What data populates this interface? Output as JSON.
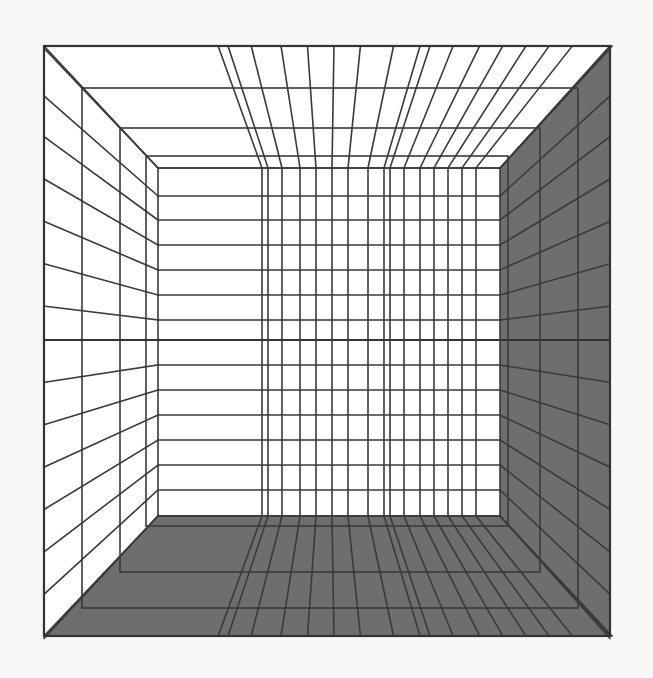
{
  "figure": {
    "title": "One-point perspective grid room",
    "colors": {
      "paper": "#f7f7f5",
      "line": "#3a3a3a",
      "shade": "#6e6e6e",
      "wall_light": "#ffffff"
    },
    "geometry": {
      "outer_frame": [
        44,
        46,
        610,
        636
      ],
      "back_wall": [
        158,
        168,
        500,
        516
      ],
      "frames": [
        [
          82,
          88,
          578,
          608
        ],
        [
          120,
          128,
          540,
          572
        ],
        [
          146,
          156,
          508,
          526
        ]
      ],
      "horizon_y": 340,
      "back_wall_rows": [
        168,
        196,
        220,
        245,
        270,
        295,
        320,
        340,
        365,
        390,
        415,
        440,
        465,
        490,
        516
      ],
      "back_wall_cols": [
        262,
        268,
        282,
        300,
        316,
        332,
        348,
        368,
        384,
        390,
        404,
        420,
        434,
        448,
        462,
        476,
        500
      ],
      "side_wall_cols_left": [
        44,
        82,
        120,
        146,
        158
      ],
      "side_wall_cols_right": [
        500,
        508,
        540,
        578,
        610
      ]
    },
    "shaded_surfaces": [
      "right-wall",
      "floor"
    ],
    "unshaded_surfaces": [
      "left-wall",
      "ceiling",
      "back-wall"
    ]
  }
}
